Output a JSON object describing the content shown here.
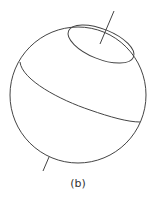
{
  "figure": {
    "caption": "(b)",
    "stroke_color": "#444444"
  }
}
